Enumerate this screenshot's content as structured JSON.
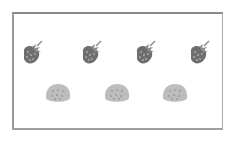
{
  "picture": {
    "title": "Count the objects",
    "rows": [
      {
        "name": "strawberries",
        "icon": "strawberry-icon",
        "count": 4
      },
      {
        "name": "buns",
        "icon": "bun-icon",
        "count": 3
      }
    ]
  },
  "colors": {
    "frame": "#9a9a9a",
    "strawberry_body": "#6e6e6e",
    "strawberry_leaf": "#8c8c8c",
    "bun_body": "#bdbdbd",
    "bun_dots": "#9e9e9e"
  }
}
